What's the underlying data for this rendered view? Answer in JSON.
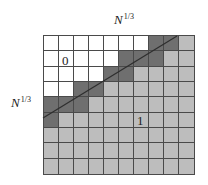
{
  "diagram": {
    "type": "grid-partition",
    "rows": 9,
    "cols": 10,
    "colors": {
      "white": "#ffffff",
      "dark": "#6f6f6f",
      "gray": "#bdbdbd",
      "grid_line": "#4a4a4a",
      "diagonal": "#2e2e2e"
    },
    "cells": [
      [
        "white",
        "white",
        "white",
        "white",
        "white",
        "white",
        "white",
        "dark",
        "dark",
        "gray"
      ],
      [
        "white",
        "white",
        "white",
        "white",
        "white",
        "dark",
        "dark",
        "dark",
        "gray",
        "gray"
      ],
      [
        "white",
        "white",
        "white",
        "white",
        "dark",
        "dark",
        "gray",
        "gray",
        "gray",
        "gray"
      ],
      [
        "white",
        "white",
        "dark",
        "dark",
        "gray",
        "gray",
        "gray",
        "gray",
        "gray",
        "gray"
      ],
      [
        "dark",
        "dark",
        "dark",
        "gray",
        "gray",
        "gray",
        "gray",
        "gray",
        "gray",
        "gray"
      ],
      [
        "dark",
        "gray",
        "gray",
        "gray",
        "gray",
        "gray",
        "gray",
        "gray",
        "gray",
        "gray"
      ],
      [
        "gray",
        "gray",
        "gray",
        "gray",
        "gray",
        "gray",
        "gray",
        "gray",
        "gray",
        "gray"
      ],
      [
        "gray",
        "gray",
        "gray",
        "gray",
        "gray",
        "gray",
        "gray",
        "gray",
        "gray",
        "gray"
      ],
      [
        "gray",
        "gray",
        "gray",
        "gray",
        "gray",
        "gray",
        "gray",
        "gray",
        "gray",
        "gray"
      ]
    ],
    "diagonal_line": {
      "x1": 43,
      "y1": 118,
      "x2": 177,
      "y2": 36
    },
    "labels": {
      "top": {
        "base": "N",
        "exp": "1/3"
      },
      "left": {
        "base": "N",
        "exp": "1/3"
      },
      "region_zero": "0",
      "region_one": "1"
    }
  }
}
